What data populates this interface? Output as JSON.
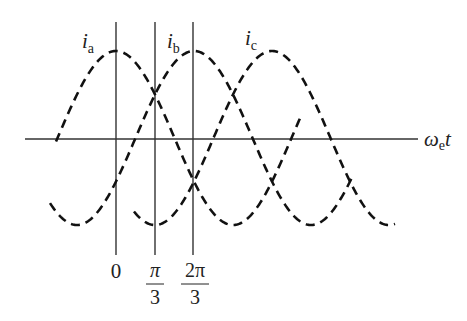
{
  "diagram": {
    "axis_label": {
      "main": "ω",
      "sub": "e",
      "tail": "t"
    },
    "curves": [
      {
        "id": "ia",
        "label_main": "i",
        "label_sub": "a",
        "phase_deg": 0
      },
      {
        "id": "ib",
        "label_main": "i",
        "label_sub": "b",
        "phase_deg": 120
      },
      {
        "id": "ic",
        "label_main": "i",
        "label_sub": "c",
        "phase_deg": 240
      }
    ],
    "markers": [
      {
        "label": "0",
        "position_rad": 0
      },
      {
        "label_num": "π",
        "label_den": "3",
        "position_rad": 1.0472
      },
      {
        "label_num": "2π",
        "label_den": "3",
        "position_rad": 2.0944
      }
    ],
    "style": {
      "curve_color": "#111111",
      "axis_color": "#333333",
      "background": "#ffffff",
      "line_style": "dashed"
    }
  },
  "chart_data": {
    "type": "line",
    "title": "",
    "xlabel": "ωe t",
    "ylabel": "",
    "x_ticks": [
      "0",
      "π/3",
      "2π/3"
    ],
    "series": [
      {
        "name": "ia",
        "function": "cos(ωe t)",
        "phase_rad": 0
      },
      {
        "name": "ib",
        "function": "cos(ωe t − 2π/3)",
        "phase_rad": -2.0944
      },
      {
        "name": "ic",
        "function": "cos(ωe t − 4π/3)",
        "phase_rad": -4.1888
      }
    ],
    "x_range_rad": [
      -1.75,
      7.1
    ],
    "ylim": [
      -1,
      1
    ],
    "grid": false,
    "legend": "inline labels above peaks"
  }
}
